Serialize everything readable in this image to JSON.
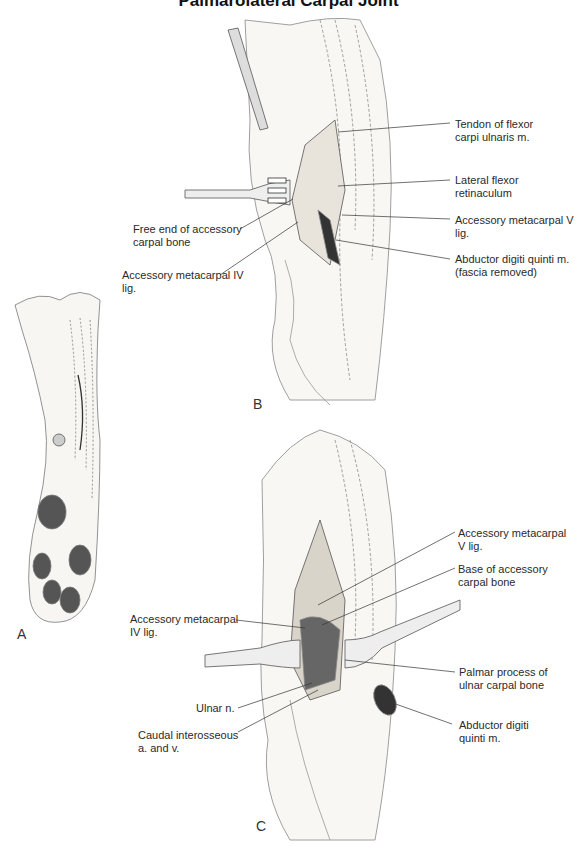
{
  "title": "Palmarolateral Carpal Joint",
  "panels": {
    "a": {
      "letter": "A"
    },
    "b": {
      "letter": "B",
      "labels": [
        {
          "line1": "Tendon of flexor",
          "line2": "carpi ulnaris m."
        },
        {
          "line1": "Lateral flexor",
          "line2": "retinaculum"
        },
        {
          "line1": "Accessory metacarpal V",
          "line2": "lig."
        },
        {
          "line1": "Abductor digiti quinti m.",
          "line2": "(fascia removed)"
        },
        {
          "line1": "Free end of accessory",
          "line2": "carpal bone"
        },
        {
          "line1": "Accessory metacarpal IV",
          "line2": "lig."
        }
      ]
    },
    "c": {
      "letter": "C",
      "labels": [
        {
          "line1": "Accessory metacarpal",
          "line2": "V lig."
        },
        {
          "line1": "Base of accessory",
          "line2": "carpal bone"
        },
        {
          "line1": "Accessory metacarpal",
          "line2": "IV lig."
        },
        {
          "line1": "Palmar process of",
          "line2": "ulnar carpal bone"
        },
        {
          "line1": "Ulnar n.",
          "line2": ""
        },
        {
          "line1": "Caudal interosseous",
          "line2": "a. and v."
        },
        {
          "line1": "Abductor digiti",
          "line2": "quinti m."
        }
      ]
    }
  }
}
